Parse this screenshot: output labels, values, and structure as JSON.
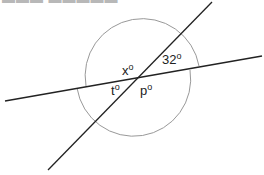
{
  "diagram": {
    "type": "intersecting-lines-with-angle-arcs",
    "labels": {
      "top_right": {
        "value": "32",
        "unit": "o"
      },
      "top_left": {
        "value": "x",
        "unit": "o"
      },
      "bottom_left": {
        "value": "t",
        "unit": "o"
      },
      "bottom_right": {
        "value": "p",
        "unit": "o"
      }
    },
    "colors": {
      "line": "#222222",
      "arc": "#888888"
    }
  }
}
